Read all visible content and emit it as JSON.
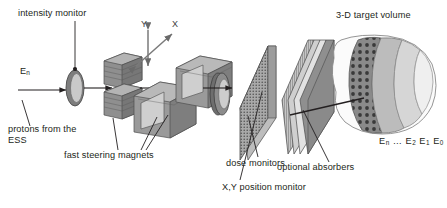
{
  "figure": {
    "domain": "beamline-schematic",
    "background": "#ffffff"
  },
  "labels": {
    "intensity_monitor": "intensity monitor",
    "beam_energy": "E",
    "beam_energy_sub": "n",
    "protons_source": "protons from the ESS",
    "steering_magnets": "fast steering magnets",
    "dose_monitors": "dose monitors",
    "position_monitor": "X,Y position monitor",
    "optional_absorbers": "optional absorbers",
    "target_volume": "3-D target volume"
  },
  "axes": {
    "y_label": "Y",
    "x_label": "X"
  },
  "energy_layers": {
    "items": [
      {
        "base": "E",
        "sub": "n"
      },
      {
        "base": "…",
        "sub": ""
      },
      {
        "base": "E",
        "sub": "2"
      },
      {
        "base": "E",
        "sub": "1"
      },
      {
        "base": "E",
        "sub": "0"
      }
    ]
  },
  "colors": {
    "ink": "#231f20",
    "gray_dark": "#6f6f6f",
    "gray_mid": "#8d8d8d",
    "gray_light": "#b8b8b8",
    "gray_pale": "#d8d8d8",
    "gray_faint": "#ececec",
    "outline": "#4a4a4a"
  },
  "components": [
    {
      "name": "intensity-monitor",
      "shape": "ellipse-ring"
    },
    {
      "name": "fast-steering-magnet-upper",
      "shape": "stacked-cube"
    },
    {
      "name": "fast-steering-magnet-lower",
      "shape": "stacked-cube"
    },
    {
      "name": "fast-steering-magnet-front",
      "shape": "stacked-cube"
    },
    {
      "name": "fast-steering-magnet-rear",
      "shape": "stacked-cube"
    },
    {
      "name": "dose-monitor",
      "shape": "ring-disc"
    },
    {
      "name": "xy-position-monitor",
      "shape": "mesh-plate"
    },
    {
      "name": "optional-absorber",
      "shape": "slab-plate"
    },
    {
      "name": "target-volume",
      "shape": "nested-onion"
    }
  ]
}
